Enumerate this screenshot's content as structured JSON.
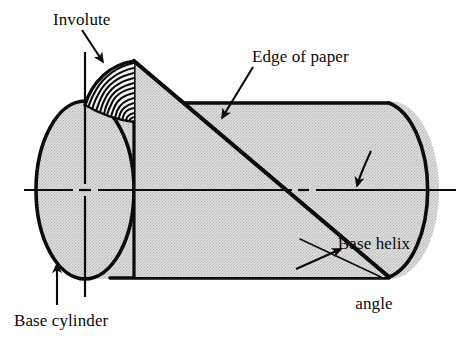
{
  "figure": {
    "type": "technical-line-diagram",
    "background_color": "#ffffff",
    "ink_color": "#0b0b0b",
    "surface_fill_color": "#d2d2d2",
    "labels": {
      "involute": "Involute",
      "edge_of_paper": "Edge of paper",
      "base_helix_angle": "Base helix\nangle",
      "base_helix_angle_line1": "Base helix",
      "base_helix_angle_line2": "angle",
      "base_cylinder": "Base cylinder"
    },
    "leader_arrows": [
      {
        "name": "involute-leader",
        "from": [
          82,
          30
        ],
        "to": [
          104,
          64
        ]
      },
      {
        "name": "edge-of-paper-leader",
        "from": [
          252,
          68
        ],
        "to": [
          221,
          120
        ]
      },
      {
        "name": "base-helix-angle-leader",
        "from": [
          370,
          152
        ],
        "to": [
          357,
          188
        ]
      },
      {
        "name": "base-helix-angle-lower-leader",
        "from": [
          297,
          268
        ],
        "to": [
          343,
          248
        ]
      },
      {
        "name": "base-cylinder-leader",
        "from": [
          57,
          303
        ],
        "to": [
          57,
          262
        ]
      }
    ],
    "geometry": {
      "cylinder_left_ellipse_center": [
        85,
        190
      ],
      "cylinder_left_ellipse_rx": 49,
      "cylinder_left_ellipse_ry": 89,
      "cylinder_right_ellipse_center": [
        390,
        190
      ],
      "cylinder_right_ellipse_rx": 49,
      "cylinder_right_ellipse_ry": 89,
      "cylinder_top_edge_y": 103,
      "cylinder_bottom_edge_y": 278,
      "paper_apex": [
        134,
        61
      ],
      "paper_base_left": [
        134,
        190
      ],
      "paper_diagonal_end": [
        389,
        277
      ],
      "centerline_horizontal_y": 190,
      "centerline_vertical_x": 85,
      "involute_arc_count": 13
    }
  }
}
